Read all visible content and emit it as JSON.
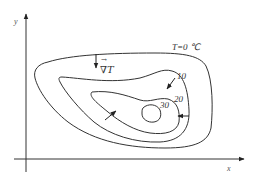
{
  "diagram": {
    "axes": {
      "x_label": "x",
      "y_label": "y"
    },
    "isotherms": [
      {
        "label": "T=0 ℃",
        "value": 0
      },
      {
        "label": "10",
        "value": 10
      },
      {
        "label": "20",
        "value": 20
      },
      {
        "label": "30",
        "value": 30
      }
    ],
    "gradient_label": "∇T",
    "gradient_arrow_symbol": "→",
    "colors": {
      "line": "#333333",
      "background": "#ffffff"
    }
  }
}
